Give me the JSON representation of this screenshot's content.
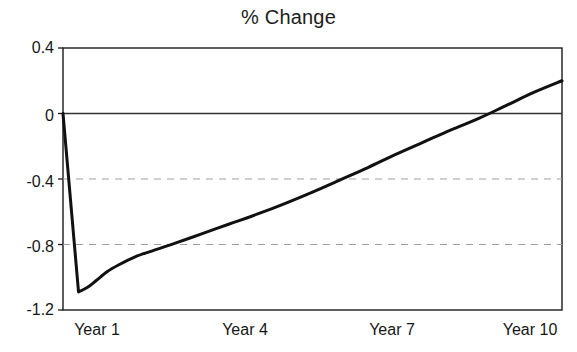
{
  "chart_data": {
    "type": "line",
    "title": "% Change",
    "xlabel": "",
    "ylabel": "",
    "grid": "horizontal-dashed",
    "legend": "none",
    "xlim": [
      1,
      10
    ],
    "ylim": [
      -1.2,
      0.4
    ],
    "yticks": [
      0.4,
      0,
      -0.4,
      -0.8,
      -1.2
    ],
    "ytick_labels": [
      "0.4",
      "0",
      "-0.4",
      "-0.8",
      "-1.2"
    ],
    "xticks": [
      1,
      4,
      7,
      10
    ],
    "xtick_labels": [
      "Year 1",
      "Year 4",
      "Year 7",
      "Year 10"
    ],
    "gridlines_at": [
      -0.4,
      -0.8
    ],
    "zero_line": 0,
    "series": [
      {
        "name": "% Change",
        "color": "#111111",
        "linewidth": 3,
        "x": [
          1.0,
          1.28,
          1.45,
          1.6,
          1.8,
          2.0,
          2.3,
          2.6,
          3.0,
          3.5,
          4.0,
          4.5,
          5.0,
          5.5,
          6.0,
          6.5,
          7.0,
          7.5,
          8.0,
          8.5,
          9.0,
          9.5,
          10.0
        ],
        "values": [
          0.0,
          -1.09,
          -1.06,
          -1.02,
          -0.965,
          -0.925,
          -0.875,
          -0.84,
          -0.795,
          -0.735,
          -0.675,
          -0.615,
          -0.55,
          -0.48,
          -0.405,
          -0.33,
          -0.25,
          -0.175,
          -0.1,
          -0.03,
          0.05,
          0.13,
          0.2
        ]
      }
    ]
  },
  "axes": {
    "frame_color": "#1a1a1a",
    "grid_color": "#9aa0aa",
    "zero_line_color": "#333333",
    "background": "#ffffff"
  }
}
